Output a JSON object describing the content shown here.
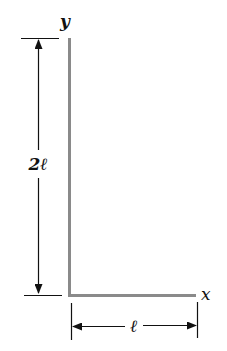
{
  "diagram": {
    "axes": {
      "y_label": "y",
      "x_label": "x"
    },
    "dimensions": {
      "vertical_label": "2ℓ",
      "horizontal_label": "ℓ"
    },
    "colors": {
      "bar": "#8a8a8a",
      "line": "#111111"
    }
  }
}
